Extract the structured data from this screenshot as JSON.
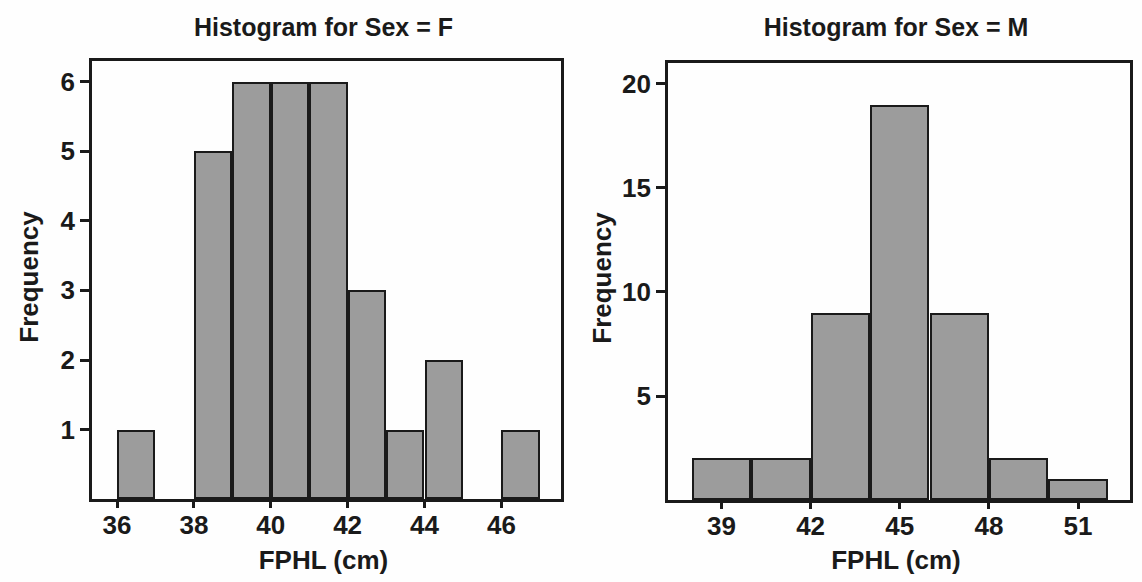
{
  "figure": {
    "background": "#fefefe",
    "text_color": "#1a1a1a",
    "bar_fill": "#9c9c9c",
    "bar_stroke": "#1a1a1a",
    "axis_stroke": "#1a1a1a"
  },
  "chart_data": [
    {
      "type": "bar",
      "chart_kind": "histogram",
      "title": "Histogram for Sex = F",
      "xlabel": "FPHL (cm)",
      "ylabel": "Frequency",
      "x_ticks": [
        36,
        38,
        40,
        42,
        44,
        46
      ],
      "y_ticks": [
        1,
        2,
        3,
        4,
        5,
        6
      ],
      "xlim": [
        35.35,
        47.55
      ],
      "ylim": [
        0,
        6.3
      ],
      "grid": false,
      "legend": false,
      "bins": [
        {
          "x0": 36,
          "x1": 37,
          "count": 1
        },
        {
          "x0": 37,
          "x1": 38,
          "count": 0
        },
        {
          "x0": 38,
          "x1": 39,
          "count": 5
        },
        {
          "x0": 39,
          "x1": 40,
          "count": 6
        },
        {
          "x0": 40,
          "x1": 41,
          "count": 6
        },
        {
          "x0": 41,
          "x1": 42,
          "count": 6
        },
        {
          "x0": 42,
          "x1": 43,
          "count": 3
        },
        {
          "x0": 43,
          "x1": 44,
          "count": 1
        },
        {
          "x0": 44,
          "x1": 45,
          "count": 2
        },
        {
          "x0": 45,
          "x1": 46,
          "count": 0
        },
        {
          "x0": 46,
          "x1": 47,
          "count": 1
        }
      ]
    },
    {
      "type": "bar",
      "chart_kind": "histogram",
      "title": "Histogram for Sex = M",
      "xlabel": "FPHL (cm)",
      "ylabel": "Frequency",
      "x_ticks": [
        39,
        42,
        45,
        48,
        51
      ],
      "y_ticks": [
        5,
        10,
        15,
        20
      ],
      "xlim": [
        37.2,
        52.75
      ],
      "ylim": [
        0,
        21
      ],
      "grid": false,
      "legend": false,
      "bins": [
        {
          "x0": 38,
          "x1": 40,
          "count": 2
        },
        {
          "x0": 40,
          "x1": 42,
          "count": 2
        },
        {
          "x0": 42,
          "x1": 44,
          "count": 9
        },
        {
          "x0": 44,
          "x1": 46,
          "count": 19
        },
        {
          "x0": 46,
          "x1": 48,
          "count": 9
        },
        {
          "x0": 48,
          "x1": 50,
          "count": 2
        },
        {
          "x0": 50,
          "x1": 52,
          "count": 1
        }
      ]
    }
  ]
}
